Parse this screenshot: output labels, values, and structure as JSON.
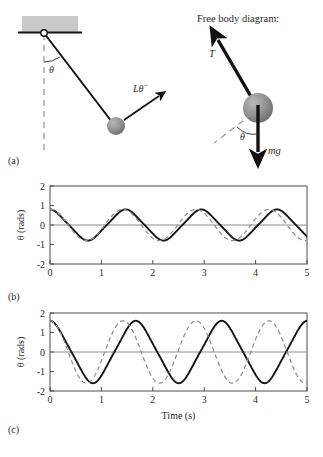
{
  "figure": {
    "panels": [
      {
        "id": "a",
        "label": "(a)"
      },
      {
        "id": "b",
        "label": "(b)"
      },
      {
        "id": "c",
        "label": "(c)"
      }
    ]
  },
  "diagram": {
    "fbd_title": "Free body diagram:",
    "theta_symbol": "θ",
    "pendulum_force_label": "Lθ̈",
    "tension_label": "T",
    "weight_label": "mg",
    "ceiling_fill": "#c9c9c9",
    "bob_fill": "#8a8a8a",
    "arrow_color": "#111111",
    "dashed_color": "#9a9a9a"
  },
  "chart_data": [
    {
      "type": "line",
      "panel": "b",
      "title": "",
      "xlabel": "",
      "ylabel": "θ (rads)",
      "xlim": [
        0,
        5
      ],
      "ylim": [
        -2,
        2
      ],
      "xticks": [
        0,
        1,
        2,
        3,
        4,
        5
      ],
      "yticks": [
        -2,
        -1,
        0,
        1,
        2
      ],
      "xticklabels": [
        "0",
        "1",
        "2",
        "3",
        "4",
        "5"
      ],
      "yticklabels": [
        "-2",
        "-1",
        "0",
        "1",
        "2"
      ],
      "grid": false,
      "legend": "none",
      "zero_line": true,
      "series": [
        {
          "name": "nonlinear pendulum",
          "style": "solid",
          "color": "#141414",
          "amplitude": 0.8,
          "period": 1.472,
          "phase": 0,
          "description": "theta0 = 0.8 rad, exact nonlinear solution, slightly longer period"
        },
        {
          "name": "linearized pendulum",
          "style": "dashed",
          "color": "#8f8f8f",
          "amplitude": 0.8,
          "period": 1.42,
          "phase": 0,
          "description": "small-angle approximation, period 2*pi*sqrt(L/g)"
        }
      ]
    },
    {
      "type": "line",
      "panel": "c",
      "title": "",
      "xlabel": "Time (s)",
      "ylabel": "θ (rads)",
      "xlim": [
        0,
        5
      ],
      "ylim": [
        -2,
        2
      ],
      "xticks": [
        0,
        1,
        2,
        3,
        4,
        5
      ],
      "yticks": [
        -2,
        -1,
        0,
        1,
        2
      ],
      "xticklabels": [
        "0",
        "1",
        "2",
        "3",
        "4",
        "5"
      ],
      "yticklabels": [
        "-2",
        "-1",
        "0",
        "1",
        "2"
      ],
      "grid": false,
      "legend": "none",
      "zero_line": true,
      "series": [
        {
          "name": "nonlinear pendulum",
          "style": "solid",
          "color": "#141414",
          "amplitude": 1.6,
          "period": 1.67,
          "phase": 0,
          "description": "theta0 = 1.6 rad, exact nonlinear solution, noticeably longer period"
        },
        {
          "name": "linearized pendulum",
          "style": "dashed",
          "color": "#8f8f8f",
          "amplitude": 1.6,
          "period": 1.42,
          "phase": 0,
          "description": "small-angle approximation diverges in phase from the exact solution"
        }
      ]
    }
  ]
}
